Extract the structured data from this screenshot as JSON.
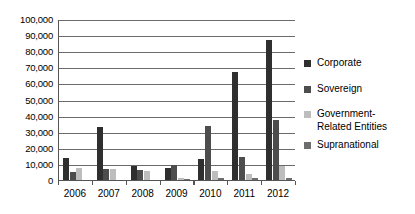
{
  "chart_data": {
    "type": "bar",
    "title": "",
    "subtitle": "",
    "xlabel": "",
    "ylabel": "",
    "categories": [
      "2006",
      "2007",
      "2008",
      "2009",
      "2010",
      "2011",
      "2012"
    ],
    "series": [
      {
        "name": "Corporate",
        "color": "#2f2f2f",
        "values": [
          13500,
          33000,
          9000,
          7500,
          13000,
          67000,
          87000
        ]
      },
      {
        "name": "Sovereign",
        "color": "#4d4d4d",
        "values": [
          5000,
          7000,
          6000,
          9500,
          33500,
          14000,
          37000
        ]
      },
      {
        "name": "Government-\nRelated Entities",
        "color": "#bdbdbd",
        "values": [
          7500,
          7000,
          5500,
          1000,
          5500,
          4000,
          9000
        ]
      },
      {
        "name": "Supranational",
        "color": "#6e6e6e",
        "values": [
          0,
          0,
          0,
          500,
          1500,
          1000,
          1500
        ]
      }
    ],
    "ylim": [
      0,
      100000
    ],
    "ytick_step": 10000,
    "ytick_labels": [
      "100,000",
      "90,000",
      "80,000",
      "70,000",
      "60,000",
      "50,000",
      "40,000",
      "30,000",
      "20,000",
      "10,000",
      "0"
    ],
    "ytick_values": [
      100000,
      90000,
      80000,
      70000,
      60000,
      50000,
      40000,
      30000,
      20000,
      10000,
      0
    ],
    "grid": true,
    "grid_axis": "y",
    "legend_position": "right",
    "legend_entries": [
      "Corporate",
      "Sovereign",
      "Government-\nRelated Entities",
      "Supranational"
    ]
  }
}
